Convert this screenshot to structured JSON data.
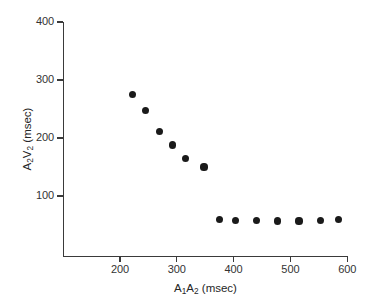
{
  "chart_data": {
    "type": "scatter",
    "title": "",
    "xlabel": "A1A2 (msec)",
    "ylabel": "A2V2 (msec)",
    "xlabel_parts": {
      "a": "A",
      "sub1": "1",
      "b": "A",
      "sub2": "2",
      "units": " (msec)"
    },
    "ylabel_parts": {
      "a": "A",
      "sub1": "2",
      "b": "V",
      "sub2": "2",
      "units": " (msec)"
    },
    "xlim": [
      110,
      600
    ],
    "ylim": [
      0,
      400
    ],
    "xticks": [
      200,
      300,
      400,
      500,
      600
    ],
    "yticks": [
      100,
      200,
      300,
      400
    ],
    "xtick_labels": [
      "200",
      "300",
      "400",
      "500",
      "600"
    ],
    "ytick_labels": [
      "100",
      "200",
      "300",
      "400"
    ],
    "grid": false,
    "legend": "none",
    "marker": "filled-circle",
    "marker_color": "#1a1a1a",
    "series": [
      {
        "name": "A2V2 conduction curve",
        "points": [
          {
            "x": 222,
            "y": 275
          },
          {
            "x": 245,
            "y": 247
          },
          {
            "x": 269,
            "y": 211
          },
          {
            "x": 292,
            "y": 188
          },
          {
            "x": 315,
            "y": 164
          },
          {
            "x": 348,
            "y": 150
          },
          {
            "x": 375,
            "y": 60
          },
          {
            "x": 403,
            "y": 58
          },
          {
            "x": 440,
            "y": 58
          },
          {
            "x": 478,
            "y": 57
          },
          {
            "x": 515,
            "y": 57
          },
          {
            "x": 553,
            "y": 58
          },
          {
            "x": 585,
            "y": 59
          }
        ]
      }
    ]
  },
  "axes": {
    "x_title_text": "A1A2 (msec)",
    "y_title_text": "A2V2 (msec)"
  }
}
